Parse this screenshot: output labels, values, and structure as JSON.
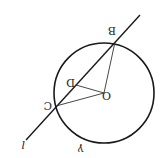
{
  "diagram": {
    "orientation": "rotated 180 degrees",
    "stroke_color": "#1a1a1a",
    "background": "#ffffff",
    "circle": {
      "label": "γ",
      "cx": 104,
      "cy": 93,
      "r": 50
    },
    "line": {
      "label": "l",
      "x1": 140,
      "y1": 15,
      "x2": 26,
      "y2": 140
    },
    "points": {
      "O": {
        "label": "O",
        "x": 104,
        "y": 93
      },
      "B": {
        "label": "B",
        "x": 115,
        "y": 42
      },
      "C": {
        "label": "C",
        "x": 56,
        "y": 106
      },
      "D": {
        "label": "D",
        "x": 76,
        "y": 85
      }
    },
    "segments": [
      "OB",
      "OC",
      "OD"
    ]
  }
}
